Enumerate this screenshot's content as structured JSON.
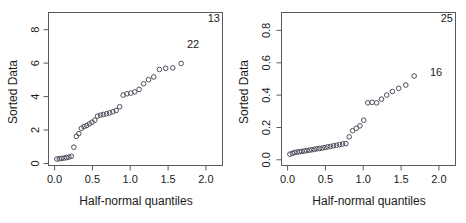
{
  "figure": {
    "title": "",
    "panel_count": 2
  },
  "chart_data": [
    {
      "type": "scatter",
      "title": "",
      "panel": "left",
      "xlabel": "Half-normal quantiles",
      "ylabel": "Sorted Data",
      "xlim": [
        -0.08,
        2.22
      ],
      "ylim": [
        -0.35,
        9.1
      ],
      "xticks": [
        0.0,
        0.5,
        1.0,
        1.5,
        2.0
      ],
      "xticklabels": [
        "0.0",
        "0.5",
        "1.0",
        "1.5",
        "2.0"
      ],
      "yticks": [
        0,
        2,
        4,
        6,
        8
      ],
      "yticklabels": [
        "0",
        "2",
        "4",
        "6",
        "8"
      ],
      "grid": false,
      "legend": null,
      "marker": "open-circle",
      "x": [
        0.031,
        0.063,
        0.094,
        0.126,
        0.158,
        0.19,
        0.222,
        0.255,
        0.288,
        0.321,
        0.355,
        0.389,
        0.424,
        0.459,
        0.495,
        0.532,
        0.569,
        0.608,
        0.647,
        0.687,
        0.728,
        0.771,
        0.815,
        0.86,
        0.907,
        0.956,
        1.007,
        1.061,
        1.118,
        1.178,
        1.242,
        1.311,
        1.386,
        1.469,
        1.563,
        1.674
      ],
      "y": [
        0.05,
        0.07,
        0.09,
        0.11,
        0.14,
        0.17,
        0.22,
        0.78,
        1.45,
        1.62,
        1.95,
        2.05,
        2.12,
        2.22,
        2.32,
        2.45,
        2.7,
        2.76,
        2.8,
        2.85,
        2.9,
        2.97,
        3.05,
        3.28,
        4.0,
        4.08,
        4.12,
        4.2,
        4.35,
        4.7,
        4.95,
        5.12,
        5.58,
        5.65,
        5.68,
        5.95
      ],
      "annotations": [
        {
          "text": "13",
          "position": "top-right-corner"
        },
        {
          "text": "22",
          "position": "near-top-right-interior"
        }
      ]
    },
    {
      "type": "scatter",
      "title": "",
      "panel": "right",
      "xlabel": "Half-normal quantiles",
      "ylabel": "Sorted Data",
      "xlim": [
        -0.08,
        2.22
      ],
      "ylim": [
        -0.035,
        0.91
      ],
      "xticks": [
        0.0,
        0.5,
        1.0,
        1.5,
        2.0
      ],
      "xticklabels": [
        "0.0",
        "0.5",
        "1.0",
        "1.5",
        "2.0"
      ],
      "yticks": [
        0.0,
        0.2,
        0.4,
        0.6,
        0.8
      ],
      "yticklabels": [
        "0.0",
        "0.2",
        "0.4",
        "0.6",
        "0.8"
      ],
      "grid": false,
      "legend": null,
      "marker": "open-circle",
      "x": [
        0.031,
        0.063,
        0.094,
        0.126,
        0.158,
        0.19,
        0.222,
        0.255,
        0.288,
        0.321,
        0.355,
        0.389,
        0.424,
        0.459,
        0.495,
        0.532,
        0.569,
        0.608,
        0.647,
        0.687,
        0.728,
        0.771,
        0.815,
        0.86,
        0.907,
        0.956,
        1.007,
        1.061,
        1.118,
        1.178,
        1.242,
        1.311,
        1.386,
        1.469,
        1.563,
        1.674
      ],
      "y": [
        0.035,
        0.04,
        0.045,
        0.048,
        0.05,
        0.052,
        0.055,
        0.057,
        0.06,
        0.062,
        0.065,
        0.068,
        0.07,
        0.073,
        0.076,
        0.08,
        0.083,
        0.087,
        0.09,
        0.094,
        0.098,
        0.1,
        0.142,
        0.18,
        0.195,
        0.21,
        0.245,
        0.352,
        0.355,
        0.352,
        0.375,
        0.4,
        0.422,
        0.442,
        0.462,
        0.518
      ],
      "annotations": [
        {
          "text": "25",
          "position": "top-right-corner"
        },
        {
          "text": "16",
          "position": "near-last-point"
        }
      ]
    }
  ]
}
